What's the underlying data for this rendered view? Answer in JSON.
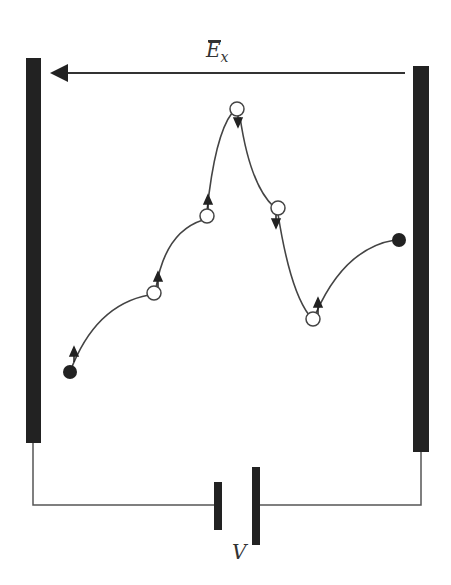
{
  "figure": {
    "field_label": "E",
    "field_label_subscript": "x",
    "voltage_label": "V",
    "colors": {
      "plate": "#222222",
      "wire": "#555555",
      "path": "#444444",
      "background": "#ffffff"
    },
    "electrodes": [
      {
        "side": "left",
        "x": 26,
        "y": 58,
        "width": 15,
        "height": 385
      },
      {
        "side": "right",
        "x": 413,
        "y": 66,
        "width": 16,
        "height": 386
      }
    ],
    "field_arrow": {
      "from": [
        405,
        73
      ],
      "to": [
        50,
        73
      ],
      "direction": "left"
    },
    "carrier_path": [
      {
        "type": "filled",
        "x": 70,
        "y": 372
      },
      {
        "type": "open",
        "x": 154,
        "y": 293
      },
      {
        "type": "open",
        "x": 207,
        "y": 216
      },
      {
        "type": "open",
        "x": 237,
        "y": 109
      },
      {
        "type": "open",
        "x": 278,
        "y": 208
      },
      {
        "type": "open",
        "x": 313,
        "y": 319
      },
      {
        "type": "filled",
        "x": 399,
        "y": 240
      }
    ],
    "battery": {
      "short_plate": {
        "x": 215,
        "y1": 482,
        "y2": 530
      },
      "long_plate": {
        "x": 252,
        "y1": 467,
        "y2": 545
      },
      "wire_y": 505
    }
  }
}
